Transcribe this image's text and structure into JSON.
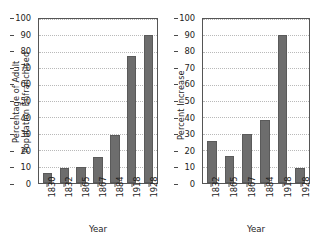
{
  "chart_data": [
    {
      "type": "bar",
      "title": "",
      "xlabel": "Year",
      "ylabel": "Percentage of Adult\nPopulation Enfranchised",
      "categories": [
        "1830",
        "1832",
        "1865",
        "1867",
        "1884",
        "1918",
        "1928"
      ],
      "values": [
        6,
        9,
        10,
        16,
        29,
        77.5,
        90
      ],
      "ylim": [
        0,
        100
      ],
      "yticks": [
        0,
        10,
        20,
        30,
        40,
        50,
        60,
        70,
        80,
        90,
        100
      ],
      "ytick_labels": [
        "0",
        "10",
        "20",
        "30",
        "40",
        "50",
        "60",
        "70",
        "80",
        "90",
        "100"
      ],
      "grid": true,
      "legend": "none",
      "bar_color": "#6d6d6d"
    },
    {
      "type": "bar",
      "title": "",
      "xlabel": "Year",
      "ylabel": "Percent Increase",
      "categories": [
        "1832",
        "1865",
        "1867",
        "1884",
        "1918",
        "1928"
      ],
      "values": [
        25.5,
        16.5,
        30,
        38.5,
        90,
        9
      ],
      "ylim": [
        0,
        100
      ],
      "yticks": [
        0,
        10,
        20,
        30,
        40,
        50,
        60,
        70,
        80,
        90,
        100
      ],
      "ytick_labels": [
        "0",
        "10",
        "20",
        "30",
        "40",
        "50",
        "60",
        "70",
        "80",
        "90",
        "100"
      ],
      "grid": true,
      "legend": "none",
      "bar_color": "#6d6d6d"
    }
  ]
}
